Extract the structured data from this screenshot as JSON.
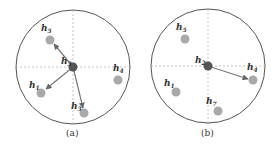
{
  "panels": [
    {
      "caption": "(a)",
      "center": {
        "label": "h",
        "sub": "3"
      },
      "nodes": [
        {
          "id": "h5",
          "label": "h",
          "sub": "5"
        },
        {
          "id": "h1",
          "label": "h",
          "sub": "1"
        },
        {
          "id": "h3b",
          "label": "h",
          "sub": "3"
        },
        {
          "id": "h4",
          "label": "h",
          "sub": "4"
        }
      ],
      "arrows_to": [
        "h5",
        "h1",
        "h3b"
      ]
    },
    {
      "caption": "(b)",
      "center": {
        "label": "h",
        "sub": "2"
      },
      "nodes": [
        {
          "id": "h5",
          "label": "h",
          "sub": "5"
        },
        {
          "id": "h1",
          "label": "h",
          "sub": "1"
        },
        {
          "id": "h7",
          "label": "h",
          "sub": "7"
        },
        {
          "id": "h4",
          "label": "h",
          "sub": "4"
        }
      ],
      "arrows_to": [
        "h4"
      ]
    }
  ],
  "colors": {
    "circle": "#555555",
    "axis": "#aaaaaa",
    "center_node": "#555555",
    "node": "#a9a9a9",
    "arrow": "#777777"
  }
}
